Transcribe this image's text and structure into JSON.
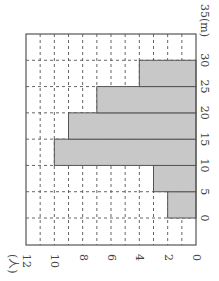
{
  "chart_data": {
    "type": "bar",
    "orientation": "histogram rotated 90° (class axis vertical, frequency axis horizontal)",
    "title": "",
    "xlabel": "(m)",
    "ylabel": "(人)",
    "bins": [
      [
        0,
        5
      ],
      [
        5,
        10
      ],
      [
        10,
        15
      ],
      [
        15,
        20
      ],
      [
        20,
        25
      ],
      [
        25,
        30
      ]
    ],
    "categories": [
      "0-5",
      "5-10",
      "10-15",
      "15-20",
      "20-25",
      "25-30"
    ],
    "values": [
      2,
      3,
      10,
      9,
      7,
      4
    ],
    "class_ticks": [
      "0",
      "5",
      "10",
      "15",
      "20",
      "25",
      "30",
      "35"
    ],
    "count_ticks": [
      "0",
      "2",
      "4",
      "6",
      "8",
      "10",
      "12"
    ],
    "xlim": [
      0,
      35
    ],
    "ylim": [
      0,
      12
    ],
    "grid": true,
    "colors": {
      "bar": "#c8c8c8",
      "bar_edge": "#555555",
      "grid": "#555555",
      "frame": "#555555"
    }
  },
  "labels": {
    "class_unit": "35(m)",
    "count_unit": "(人)"
  }
}
